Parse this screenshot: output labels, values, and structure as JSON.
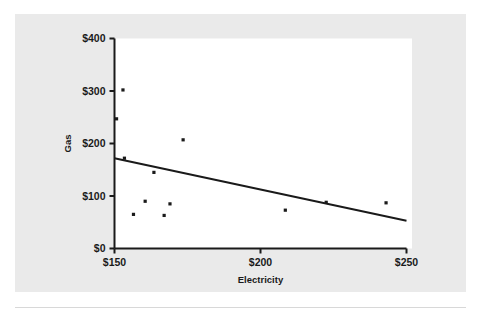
{
  "chart_data": {
    "type": "scatter",
    "title": "",
    "subtitle": "",
    "xlabel": "Electricity",
    "ylabel": "Gas",
    "xlim": [
      150,
      250
    ],
    "ylim": [
      0,
      400
    ],
    "grid": false,
    "legend": null,
    "x_tick_labels": [
      "$150",
      "$200",
      "$250"
    ],
    "x_tick_values": [
      150,
      200,
      250
    ],
    "y_tick_labels": [
      "$0",
      "$100",
      "$200",
      "$300",
      "$400"
    ],
    "y_tick_values": [
      0,
      100,
      200,
      300,
      400
    ],
    "marker_color": "#1a1a1a",
    "marker_shape": "square",
    "points": [
      {
        "x": 150.7,
        "y": 247
      },
      {
        "x": 152.9,
        "y": 302
      },
      {
        "x": 153.4,
        "y": 172
      },
      {
        "x": 156.5,
        "y": 65
      },
      {
        "x": 160.5,
        "y": 90
      },
      {
        "x": 163.5,
        "y": 145
      },
      {
        "x": 167.0,
        "y": 63
      },
      {
        "x": 169.0,
        "y": 85
      },
      {
        "x": 173.5,
        "y": 207
      },
      {
        "x": 208.5,
        "y": 73
      },
      {
        "x": 222.5,
        "y": 88
      },
      {
        "x": 243.0,
        "y": 87
      }
    ],
    "trendline": {
      "type": "linear",
      "color": "#1a1a1a",
      "x_start": 150,
      "y_start": 172,
      "x_end": 250,
      "y_end": 53,
      "slope": -1.19,
      "intercept": 350.5
    },
    "axis_color": "#1a1a1a",
    "plot_background": "#ffffff",
    "figure_background": "#eaeaea"
  }
}
